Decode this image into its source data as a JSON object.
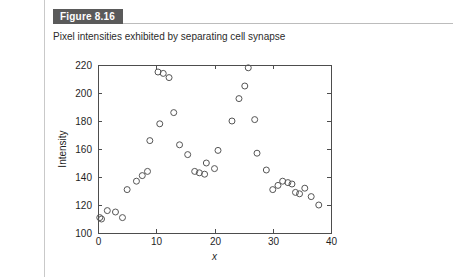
{
  "figure": {
    "label": "Figure 8.16",
    "caption": "Pixel intensities exhibited by separating cell synapse"
  },
  "colors": {
    "label_background": "#5a5a5a",
    "label_text": "#ffffff",
    "rule": "#bcbcbc",
    "left_rule": "#c9c9c9",
    "axis": "#4d4d4d",
    "marker": "#555555",
    "page_background": "#ffffff"
  },
  "chart_data": {
    "type": "scatter",
    "title": "Pixel intensities exhibited by separating cell synapse",
    "xlabel": "x",
    "ylabel": "Intensity",
    "xlim": [
      0,
      40
    ],
    "ylim": [
      100,
      220
    ],
    "xticks": [
      0,
      10,
      20,
      30,
      40
    ],
    "yticks": [
      100,
      120,
      140,
      160,
      180,
      200,
      220
    ],
    "xtick_labels": [
      "0",
      "10",
      "20",
      "30",
      "40"
    ],
    "ytick_labels": [
      "100",
      "120",
      "140",
      "160",
      "180",
      "200",
      "220"
    ],
    "grid": false,
    "legend": false,
    "marker_style": "open-circle",
    "marker_size": 3,
    "series": [
      {
        "name": "Pixel intensity",
        "points": [
          [
            0.3,
            111
          ],
          [
            0.6,
            110
          ],
          [
            1.6,
            116
          ],
          [
            3.0,
            115
          ],
          [
            4.2,
            111
          ],
          [
            5.0,
            131
          ],
          [
            6.6,
            137
          ],
          [
            7.6,
            141
          ],
          [
            8.5,
            144
          ],
          [
            8.9,
            166
          ],
          [
            10.3,
            215
          ],
          [
            10.6,
            178
          ],
          [
            11.2,
            214
          ],
          [
            12.2,
            211
          ],
          [
            13.0,
            186
          ],
          [
            14.0,
            163
          ],
          [
            15.4,
            156
          ],
          [
            16.6,
            144
          ],
          [
            17.4,
            143
          ],
          [
            18.3,
            142
          ],
          [
            18.6,
            150
          ],
          [
            20.0,
            146
          ],
          [
            20.6,
            159
          ],
          [
            23.0,
            180
          ],
          [
            24.2,
            196
          ],
          [
            25.2,
            205
          ],
          [
            25.8,
            218
          ],
          [
            26.9,
            181
          ],
          [
            27.3,
            157
          ],
          [
            28.9,
            145
          ],
          [
            30.0,
            131
          ],
          [
            30.9,
            134
          ],
          [
            31.7,
            137
          ],
          [
            32.6,
            136
          ],
          [
            33.3,
            135
          ],
          [
            33.9,
            129
          ],
          [
            34.6,
            128
          ],
          [
            35.5,
            132
          ],
          [
            36.6,
            126
          ],
          [
            37.9,
            120
          ]
        ]
      }
    ]
  },
  "plot_geometry": {
    "left": 98,
    "top": 65,
    "right": 331,
    "bottom": 233
  }
}
